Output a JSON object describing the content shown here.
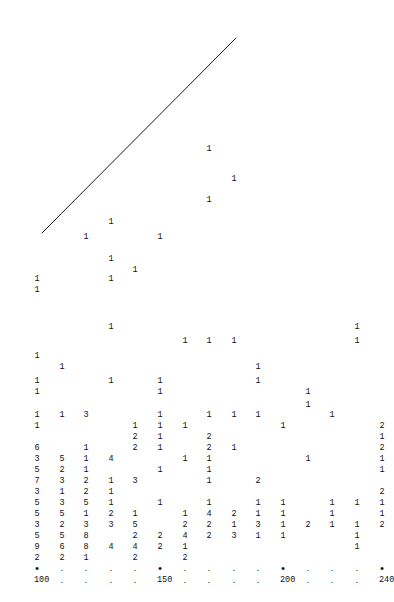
{
  "chart_data": {
    "type": "scatter",
    "title": "",
    "subtitle": "",
    "xlabel": "",
    "ylabel": "",
    "grid": false,
    "legend_position": "none",
    "xlim": [
      100,
      240
    ],
    "xtick_labels": [
      "100",
      "150",
      "200",
      "240"
    ],
    "xtick_values": [
      100,
      150,
      200,
      240
    ],
    "xtick_minor_count": 14,
    "axis_major_glyph": "•",
    "axis_minor_glyph": ".",
    "reference_line": {
      "x0": 42,
      "y0": 233,
      "x1": 236,
      "y1": 38,
      "color": "#1a1a1a",
      "width": 1
    },
    "columns_x": [
      37,
      62,
      86,
      111,
      135,
      160,
      185,
      209,
      234,
      258,
      283,
      308,
      332,
      357,
      382
    ],
    "rows": [
      {
        "y": 145,
        "cells": [
          {
            "col": 8,
            "v": "1"
          }
        ]
      },
      {
        "y": 175,
        "cells": [
          {
            "col": 9,
            "v": "1"
          }
        ]
      },
      {
        "y": 196,
        "cells": [
          {
            "col": 8,
            "v": "1"
          }
        ]
      },
      {
        "y": 218,
        "cells": [
          {
            "col": 4,
            "v": "1"
          }
        ]
      },
      {
        "y": 233,
        "cells": [
          {
            "col": 3,
            "v": "1"
          },
          {
            "col": 6,
            "v": "1"
          }
        ]
      },
      {
        "y": 255,
        "cells": [
          {
            "col": 4,
            "v": "1"
          }
        ]
      },
      {
        "y": 266,
        "cells": [
          {
            "col": 5,
            "v": "1"
          }
        ]
      },
      {
        "y": 275,
        "cells": [
          {
            "col": 1,
            "v": "1"
          },
          {
            "col": 4,
            "v": "1"
          }
        ]
      },
      {
        "y": 286,
        "cells": [
          {
            "col": 1,
            "v": "1"
          }
        ]
      },
      {
        "y": 323,
        "cells": [
          {
            "col": 4,
            "v": "1"
          },
          {
            "col": 14,
            "v": "1"
          }
        ]
      },
      {
        "y": 337,
        "cells": [
          {
            "col": 7,
            "v": "1"
          },
          {
            "col": 8,
            "v": "1"
          },
          {
            "col": 9,
            "v": "1"
          },
          {
            "col": 14,
            "v": "1"
          }
        ]
      },
      {
        "y": 352,
        "cells": [
          {
            "col": 1,
            "v": "1"
          }
        ]
      },
      {
        "y": 363,
        "cells": [
          {
            "col": 2,
            "v": "1"
          },
          {
            "col": 10,
            "v": "1"
          }
        ]
      },
      {
        "y": 377,
        "cells": [
          {
            "col": 1,
            "v": "1"
          },
          {
            "col": 4,
            "v": "1"
          },
          {
            "col": 6,
            "v": "1"
          },
          {
            "col": 10,
            "v": "1"
          }
        ]
      },
      {
        "y": 388,
        "cells": [
          {
            "col": 1,
            "v": "1"
          },
          {
            "col": 6,
            "v": "1"
          },
          {
            "col": 12,
            "v": "1"
          }
        ]
      },
      {
        "y": 401,
        "cells": [
          {
            "col": 12,
            "v": "1"
          }
        ]
      },
      {
        "y": 411,
        "cells": [
          {
            "col": 1,
            "v": "1"
          },
          {
            "col": 2,
            "v": "1"
          },
          {
            "col": 3,
            "v": "3"
          },
          {
            "col": 6,
            "v": "1"
          },
          {
            "col": 8,
            "v": "1"
          },
          {
            "col": 9,
            "v": "1"
          },
          {
            "col": 10,
            "v": "1"
          },
          {
            "col": 13,
            "v": "1"
          }
        ]
      },
      {
        "y": 422,
        "cells": [
          {
            "col": 1,
            "v": "1"
          },
          {
            "col": 5,
            "v": "1"
          },
          {
            "col": 6,
            "v": "1"
          },
          {
            "col": 7,
            "v": "1"
          },
          {
            "col": 11,
            "v": "1"
          },
          {
            "col": 15,
            "v": "2"
          }
        ]
      },
      {
        "y": 433,
        "cells": [
          {
            "col": 5,
            "v": "2"
          },
          {
            "col": 6,
            "v": "1"
          },
          {
            "col": 8,
            "v": "2"
          },
          {
            "col": 15,
            "v": "1"
          }
        ]
      },
      {
        "y": 444,
        "cells": [
          {
            "col": 1,
            "v": "6"
          },
          {
            "col": 3,
            "v": "1"
          },
          {
            "col": 5,
            "v": "2"
          },
          {
            "col": 6,
            "v": "1"
          },
          {
            "col": 8,
            "v": "2"
          },
          {
            "col": 9,
            "v": "1"
          },
          {
            "col": 15,
            "v": "2"
          }
        ]
      },
      {
        "y": 455,
        "cells": [
          {
            "col": 1,
            "v": "3"
          },
          {
            "col": 2,
            "v": "5"
          },
          {
            "col": 3,
            "v": "1"
          },
          {
            "col": 4,
            "v": "4"
          },
          {
            "col": 7,
            "v": "1"
          },
          {
            "col": 8,
            "v": "1"
          },
          {
            "col": 12,
            "v": "1"
          },
          {
            "col": 15,
            "v": "1"
          }
        ]
      },
      {
        "y": 466,
        "cells": [
          {
            "col": 1,
            "v": "5"
          },
          {
            "col": 2,
            "v": "2"
          },
          {
            "col": 3,
            "v": "1"
          },
          {
            "col": 6,
            "v": "1"
          },
          {
            "col": 8,
            "v": "1"
          },
          {
            "col": 15,
            "v": "1"
          }
        ]
      },
      {
        "y": 477,
        "cells": [
          {
            "col": 1,
            "v": "7"
          },
          {
            "col": 2,
            "v": "3"
          },
          {
            "col": 3,
            "v": "2"
          },
          {
            "col": 4,
            "v": "1"
          },
          {
            "col": 5,
            "v": "3"
          },
          {
            "col": 8,
            "v": "1"
          },
          {
            "col": 10,
            "v": "2"
          }
        ]
      },
      {
        "y": 488,
        "cells": [
          {
            "col": 1,
            "v": "3"
          },
          {
            "col": 2,
            "v": "1"
          },
          {
            "col": 3,
            "v": "2"
          },
          {
            "col": 4,
            "v": "1"
          },
          {
            "col": 15,
            "v": "2"
          }
        ]
      },
      {
        "y": 499,
        "cells": [
          {
            "col": 1,
            "v": "5"
          },
          {
            "col": 2,
            "v": "3"
          },
          {
            "col": 3,
            "v": "5"
          },
          {
            "col": 4,
            "v": "1"
          },
          {
            "col": 6,
            "v": "1"
          },
          {
            "col": 8,
            "v": "1"
          },
          {
            "col": 10,
            "v": "1"
          },
          {
            "col": 11,
            "v": "1"
          },
          {
            "col": 13,
            "v": "1"
          },
          {
            "col": 14,
            "v": "1"
          },
          {
            "col": 15,
            "v": "1"
          }
        ]
      },
      {
        "y": 510,
        "cells": [
          {
            "col": 1,
            "v": "5"
          },
          {
            "col": 2,
            "v": "5"
          },
          {
            "col": 3,
            "v": "1"
          },
          {
            "col": 4,
            "v": "2"
          },
          {
            "col": 5,
            "v": "1"
          },
          {
            "col": 7,
            "v": "1"
          },
          {
            "col": 8,
            "v": "4"
          },
          {
            "col": 9,
            "v": "2"
          },
          {
            "col": 10,
            "v": "1"
          },
          {
            "col": 11,
            "v": "1"
          },
          {
            "col": 13,
            "v": "1"
          },
          {
            "col": 15,
            "v": "1"
          }
        ]
      },
      {
        "y": 521,
        "cells": [
          {
            "col": 1,
            "v": "3"
          },
          {
            "col": 2,
            "v": "2"
          },
          {
            "col": 3,
            "v": "3"
          },
          {
            "col": 4,
            "v": "3"
          },
          {
            "col": 5,
            "v": "5"
          },
          {
            "col": 7,
            "v": "2"
          },
          {
            "col": 8,
            "v": "2"
          },
          {
            "col": 9,
            "v": "1"
          },
          {
            "col": 10,
            "v": "3"
          },
          {
            "col": 11,
            "v": "1"
          },
          {
            "col": 12,
            "v": "2"
          },
          {
            "col": 13,
            "v": "1"
          },
          {
            "col": 14,
            "v": "1"
          },
          {
            "col": 15,
            "v": "2"
          }
        ]
      },
      {
        "y": 532,
        "cells": [
          {
            "col": 1,
            "v": "5"
          },
          {
            "col": 2,
            "v": "5"
          },
          {
            "col": 3,
            "v": "8"
          },
          {
            "col": 5,
            "v": "2"
          },
          {
            "col": 6,
            "v": "2"
          },
          {
            "col": 7,
            "v": "4"
          },
          {
            "col": 8,
            "v": "2"
          },
          {
            "col": 9,
            "v": "3"
          },
          {
            "col": 10,
            "v": "1"
          },
          {
            "col": 11,
            "v": "1"
          },
          {
            "col": 14,
            "v": "1"
          }
        ]
      },
      {
        "y": 543,
        "cells": [
          {
            "col": 1,
            "v": "9"
          },
          {
            "col": 2,
            "v": "6"
          },
          {
            "col": 3,
            "v": "8"
          },
          {
            "col": 4,
            "v": "4"
          },
          {
            "col": 5,
            "v": "4"
          },
          {
            "col": 6,
            "v": "2"
          },
          {
            "col": 7,
            "v": "1"
          },
          {
            "col": 14,
            "v": "1"
          }
        ]
      },
      {
        "y": 554,
        "cells": [
          {
            "col": 1,
            "v": "2"
          },
          {
            "col": 2,
            "v": "2"
          },
          {
            "col": 3,
            "v": "1"
          },
          {
            "col": 5,
            "v": "2"
          },
          {
            "col": 7,
            "v": "2"
          }
        ]
      }
    ],
    "axis": {
      "y_tick_row": 566,
      "y_label_row": 576,
      "ticks": [
        {
          "col": 1,
          "major": true,
          "label": "100"
        },
        {
          "col": 2,
          "major": false,
          "label": ""
        },
        {
          "col": 3,
          "major": false,
          "label": ""
        },
        {
          "col": 4,
          "major": false,
          "label": ""
        },
        {
          "col": 5,
          "major": false,
          "label": ""
        },
        {
          "col": 6,
          "major": true,
          "label": "150"
        },
        {
          "col": 7,
          "major": false,
          "label": ""
        },
        {
          "col": 8,
          "major": false,
          "label": ""
        },
        {
          "col": 9,
          "major": false,
          "label": ""
        },
        {
          "col": 10,
          "major": false,
          "label": ""
        },
        {
          "col": 11,
          "major": true,
          "label": "200"
        },
        {
          "col": 12,
          "major": false,
          "label": ""
        },
        {
          "col": 13,
          "major": false,
          "label": ""
        },
        {
          "col": 14,
          "major": false,
          "label": ""
        },
        {
          "col": 15,
          "major": true,
          "label": "240"
        }
      ]
    }
  }
}
